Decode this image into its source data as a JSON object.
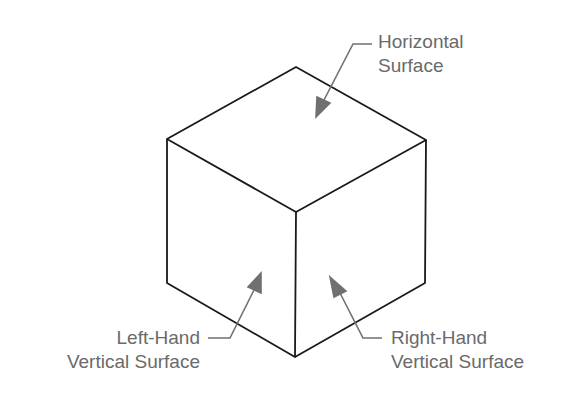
{
  "diagram": {
    "type": "isometric-cube",
    "colors": {
      "edge": "#1a1a1a",
      "leader": "#707070",
      "text": "#6a6a6a",
      "background": "#ffffff"
    },
    "labels": {
      "top": {
        "line1": "Horizontal",
        "line2": "Surface"
      },
      "left": {
        "line1": "Left-Hand",
        "line2": "Vertical Surface"
      },
      "right": {
        "line1": "Right-Hand",
        "line2": "Vertical Surface"
      }
    }
  }
}
